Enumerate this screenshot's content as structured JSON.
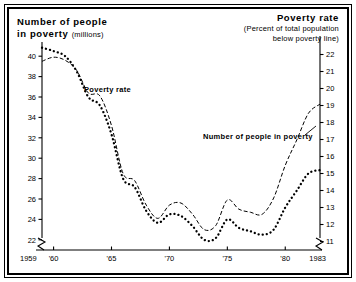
{
  "figure": {
    "left_title": {
      "line1": "Number of people",
      "line2": "in poverty",
      "units": "(millions)"
    },
    "right_title": {
      "line1": "Poverty rate",
      "line2": "(Percent of total population",
      "line3": "below poverty line)"
    },
    "series_labels": {
      "poverty_rate": "Poverty rate",
      "number_in_poverty": "Number of people in poverty"
    },
    "colors": {
      "ink": "#000000",
      "background": "#ffffff"
    },
    "axis_break_note": "both vertical axes and horizontal axis drawn with break symbols near origin"
  },
  "chart_data": {
    "type": "line",
    "title": "",
    "subtitle": "",
    "xlabel": "",
    "ylabel": "Number of people in poverty (millions)",
    "y2label": "Poverty rate (Percent of total population below poverty line)",
    "grid": false,
    "legend": "inline-annotations",
    "xlim": [
      1959,
      1983
    ],
    "ylim": [
      21,
      41
    ],
    "y2lim": [
      10.5,
      22.5
    ],
    "x": [
      1959,
      1960,
      1961,
      1962,
      1963,
      1964,
      1965,
      1966,
      1967,
      1968,
      1969,
      1970,
      1971,
      1972,
      1973,
      1974,
      1975,
      1976,
      1977,
      1978,
      1979,
      1980,
      1981,
      1982,
      1983
    ],
    "xticks": [
      1959,
      1960,
      1965,
      1970,
      1975,
      1980,
      1983
    ],
    "xticklabels": [
      "1959",
      "'60",
      "'65",
      "'70",
      "'75",
      "'80",
      "1983"
    ],
    "yticks": [
      22,
      24,
      26,
      28,
      30,
      32,
      34,
      36,
      38,
      40
    ],
    "yticklabels": [
      "22",
      "24",
      "26",
      "28",
      "30",
      "32",
      "34",
      "36",
      "38",
      "40"
    ],
    "y2ticks": [
      11,
      12,
      13,
      14,
      15,
      16,
      17,
      18,
      19,
      20,
      21,
      22
    ],
    "y2ticklabels": [
      "11",
      "12",
      "13",
      "14",
      "15",
      "16",
      "17",
      "18",
      "19",
      "20",
      "21",
      "22"
    ],
    "series": [
      {
        "name": "Number of people in poverty",
        "axis": "left",
        "units": "millions",
        "style": "dashed-line",
        "values": [
          39.5,
          39.9,
          39.6,
          38.6,
          36.4,
          36.1,
          33.2,
          28.5,
          27.8,
          25.4,
          24.1,
          25.4,
          25.6,
          24.5,
          23.0,
          23.4,
          25.9,
          25.0,
          24.7,
          24.5,
          26.1,
          29.3,
          31.8,
          34.4,
          35.3
        ]
      },
      {
        "name": "Poverty rate",
        "axis": "right",
        "units": "percent",
        "style": "dotted-line",
        "values": [
          22.4,
          22.2,
          21.9,
          21.0,
          19.5,
          19.0,
          17.3,
          14.7,
          14.2,
          12.8,
          12.1,
          12.6,
          12.5,
          11.9,
          11.1,
          11.2,
          12.3,
          11.8,
          11.6,
          11.4,
          11.7,
          13.0,
          14.0,
          15.0,
          15.2
        ]
      }
    ]
  }
}
